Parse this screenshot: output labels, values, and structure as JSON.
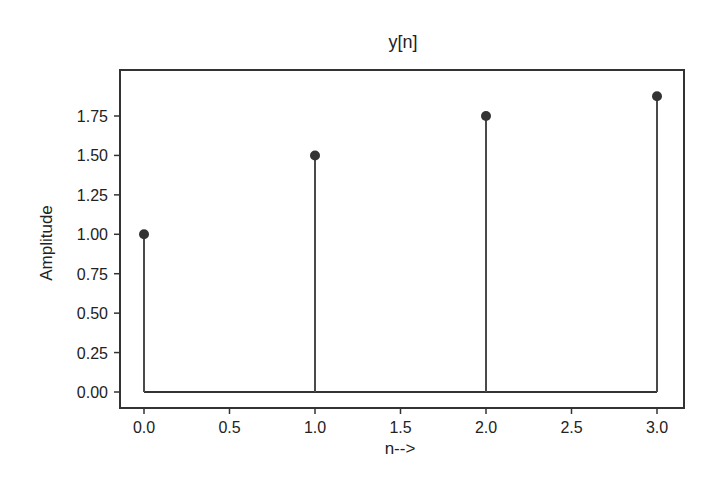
{
  "chart_data": {
    "type": "stem",
    "title": "y[n]",
    "xlabel": "n-->",
    "ylabel": "Amplitude",
    "x": [
      0,
      1,
      2,
      3
    ],
    "values": [
      1.0,
      1.5,
      1.75,
      1.875
    ],
    "xlim": [
      -0.15,
      3.15
    ],
    "ylim": [
      -0.09,
      1.97
    ],
    "xticks": [
      "0.0",
      "0.5",
      "1.0",
      "1.5",
      "2.0",
      "2.5",
      "3.0"
    ],
    "yticks": [
      "0.00",
      "0.25",
      "0.50",
      "0.75",
      "1.00",
      "1.25",
      "1.50",
      "1.75"
    ],
    "grid": false,
    "legend": null,
    "colors": {
      "stem": "#4a4a4a",
      "marker": "#333333",
      "baseline": "#333333",
      "frame": "#333333"
    }
  }
}
